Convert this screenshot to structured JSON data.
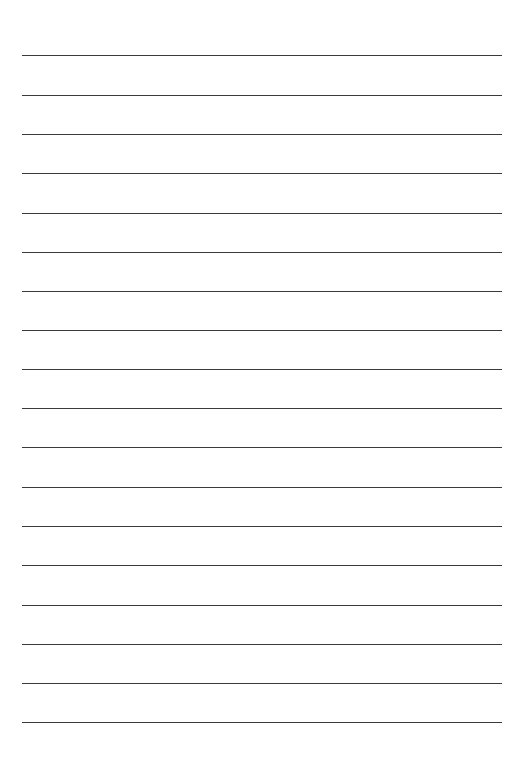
{
  "page": {
    "type": "lined-paper",
    "background_color": "#ffffff",
    "line_color": "#3a3a3a",
    "line_count": 18,
    "line_left": 22,
    "line_right": 502,
    "first_line_y": 55,
    "line_spacing": 39.24,
    "lines": [
      {
        "y": 55
      },
      {
        "y": 95
      },
      {
        "y": 134
      },
      {
        "y": 173
      },
      {
        "y": 213
      },
      {
        "y": 252
      },
      {
        "y": 291
      },
      {
        "y": 330
      },
      {
        "y": 369
      },
      {
        "y": 408
      },
      {
        "y": 447
      },
      {
        "y": 487
      },
      {
        "y": 526
      },
      {
        "y": 565
      },
      {
        "y": 605
      },
      {
        "y": 644
      },
      {
        "y": 683
      },
      {
        "y": 722
      }
    ]
  }
}
